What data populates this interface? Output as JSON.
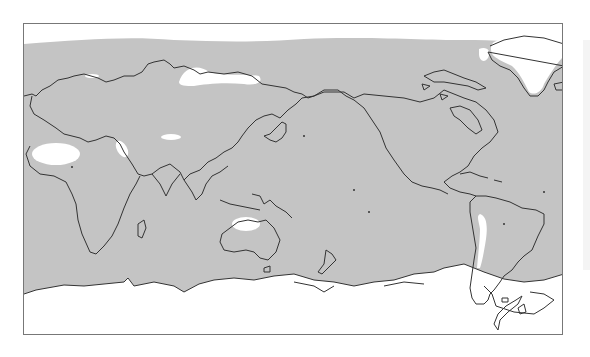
{
  "figure": {
    "type": "world-map",
    "projection": "equirectangular, Pacific-centered (0°–360° longitude)",
    "colors": {
      "shaded": "#c4c4c4",
      "unshaded": "#ffffff",
      "coastline": "#333333",
      "frame": "#777777"
    },
    "unshaded_regions": [
      "arctic-cap",
      "antarctic-cap",
      "sahara",
      "arabian-peninsula",
      "central-asia-band",
      "siberia",
      "scandinavia-patch",
      "australia-interior",
      "andes",
      "greenland"
    ]
  }
}
